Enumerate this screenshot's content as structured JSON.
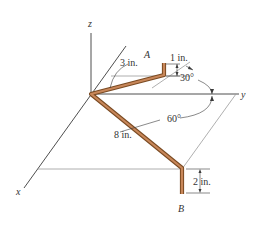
{
  "diagram": {
    "type": "3d-bent-rod",
    "axes": {
      "x_label": "x",
      "y_label": "y",
      "z_label": "z"
    },
    "points": {
      "start_label": "A",
      "end_label": "B"
    },
    "dimensions": {
      "segment_1": "3 in.",
      "segment_a_rise": "1 in.",
      "segment_2": "8 in.",
      "segment_b_drop": "2 in."
    },
    "angles": {
      "angle_1": "30°",
      "angle_2": "60°"
    },
    "colors": {
      "rod": "#c8875a",
      "rod_outline": "#7a4a22",
      "axes": "#3a3a3a",
      "reference_lines": "#9a9a9a"
    }
  }
}
